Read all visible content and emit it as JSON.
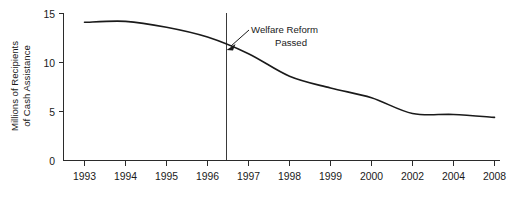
{
  "chart_data": {
    "type": "line",
    "title": "",
    "subtitle": "",
    "xlabel": "",
    "ylabel": "Millions of Recipients of Cash Assistance",
    "ylabel_line1": "Millions of Recipients",
    "ylabel_line2": "of Cash Assistance",
    "x_tick_labels": [
      "1993",
      "1994",
      "1995",
      "1996",
      "1997",
      "1998",
      "1999",
      "2000",
      "2002",
      "2004",
      "2008"
    ],
    "y_tick_labels": [
      "0",
      "5",
      "10",
      "15"
    ],
    "y_tick_values": [
      0,
      5,
      10,
      15
    ],
    "ylim": [
      0,
      15
    ],
    "grid": false,
    "legend": "none",
    "series": [
      {
        "name": "Recipients of Cash Assistance",
        "x": [
          "1993",
          "1994",
          "1995",
          "1996",
          "1997",
          "1998",
          "1999",
          "2000",
          "2002",
          "2004",
          "2008"
        ],
        "values": [
          14.1,
          14.2,
          13.6,
          12.6,
          10.9,
          8.6,
          7.4,
          6.4,
          4.8,
          4.7,
          4.4
        ]
      }
    ],
    "annotations": [
      {
        "name": "welfare-reform-marker",
        "text_line1": "Welfare Reform",
        "text_line2": "Passed",
        "text": "Welfare Reform Passed",
        "x_position": "mid-1996",
        "value_at_marker": 11.7,
        "marker_type": "vertical-line-with-arrow"
      }
    ],
    "colors": {
      "line": "#1a1a1a",
      "axis": "#2b2b2b",
      "event_line": "#3a3a3a",
      "background": "#ffffff",
      "text": "#1a1a1a"
    }
  }
}
